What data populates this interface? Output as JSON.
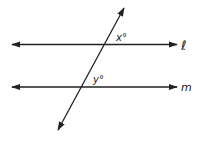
{
  "diagram": {
    "lines": [
      {
        "name": "l",
        "label": "ℓ",
        "y": 44.5,
        "x1": 12,
        "x2": 177
      },
      {
        "name": "m",
        "label": "m",
        "y": 87,
        "x1": 12,
        "x2": 177
      }
    ],
    "transversal": {
      "x1": 124,
      "y1": 8,
      "x2": 58,
      "y2": 130
    },
    "angles": [
      {
        "name": "x",
        "label": "x°"
      },
      {
        "name": "y",
        "label": "y°"
      }
    ],
    "color": "#222222"
  }
}
